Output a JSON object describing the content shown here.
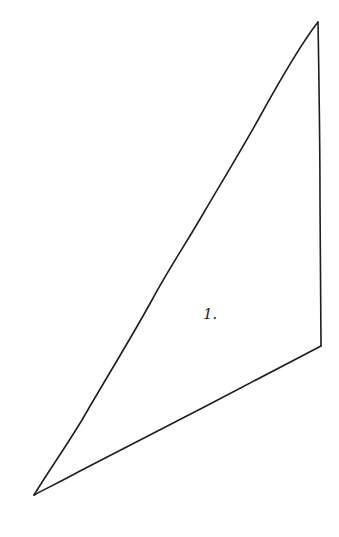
{
  "diagram": {
    "type": "hand-drawn triangle",
    "stroke_color": "#1e1e1e",
    "background_color": "#ffffff",
    "shape": {
      "name": "triangle",
      "vertices": [
        {
          "id": "top",
          "x": 318,
          "y": 22
        },
        {
          "id": "right",
          "x": 321,
          "y": 346
        },
        {
          "id": "bottom-left",
          "x": 34,
          "y": 495
        }
      ]
    },
    "label": {
      "text": "1.",
      "x": 213,
      "y": 318
    }
  }
}
